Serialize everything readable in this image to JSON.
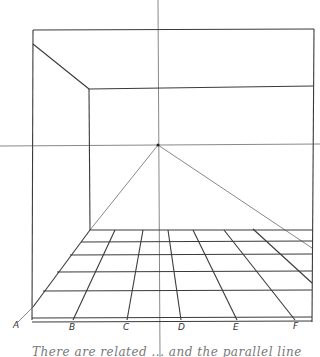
{
  "diagram": {
    "type": "one-point perspective room sketch",
    "stroke_color": "#3a3a3a",
    "guide_color": "#6a6a6a",
    "vanishing_point": {
      "x": 158,
      "y": 145
    },
    "horizon_y": 145,
    "labels": [
      {
        "text": "A",
        "x": 13,
        "y": 325
      },
      {
        "text": "B",
        "x": 69,
        "y": 327
      },
      {
        "text": "C",
        "x": 123,
        "y": 327
      },
      {
        "text": "D",
        "x": 178,
        "y": 327
      },
      {
        "text": "E",
        "x": 233,
        "y": 327
      },
      {
        "text": "F",
        "x": 293,
        "y": 326
      }
    ],
    "caption": "There are related ... and the parallel lines ... "
  }
}
